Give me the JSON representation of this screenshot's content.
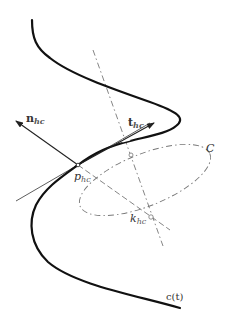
{
  "figure": {
    "labels": {
      "normal": {
        "main": "n",
        "sub": "hc"
      },
      "tangent": {
        "main": "t",
        "sub": "hc"
      },
      "point": {
        "main": "p",
        "sub": "hc"
      },
      "center": {
        "main": "k",
        "sub": "hc"
      },
      "circle": "C",
      "curve": "c(t)"
    },
    "colors": {
      "curve": "#111111",
      "construction": "#777777",
      "text": "#333333"
    }
  }
}
